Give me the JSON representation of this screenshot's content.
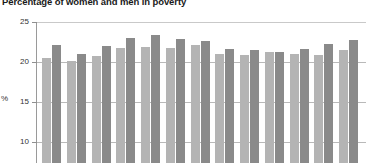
{
  "chart_data": {
    "type": "bar",
    "title": "Percentage of women and men in poverty",
    "xlabel": "",
    "ylabel": "%",
    "ylim": [
      0,
      25
    ],
    "yticks": [
      25,
      20,
      15,
      10
    ],
    "grid": true,
    "legend": "none",
    "categories": [
      "1",
      "2",
      "3",
      "4",
      "5",
      "6",
      "7",
      "8",
      "9",
      "10",
      "11",
      "12",
      "13"
    ],
    "series": [
      {
        "name": "Women",
        "color": "#b4b4b4",
        "values": [
          20.5,
          20.1,
          20.8,
          21.7,
          21.9,
          21.8,
          22.1,
          21.0,
          20.9,
          21.2,
          21.0,
          20.9,
          21.5
        ]
      },
      {
        "name": "Men",
        "color": "#8a8a8a",
        "values": [
          22.1,
          21.0,
          22.0,
          23.0,
          23.4,
          22.9,
          22.6,
          21.6,
          21.5,
          21.3,
          21.6,
          22.2,
          22.7
        ]
      }
    ],
    "note": "Plot is cropped: bar baseline and x-axis tick labels fall below the visible image area."
  },
  "axis": {
    "y_label": "%",
    "tick_labels": [
      "25",
      "20",
      "15",
      "10"
    ]
  }
}
